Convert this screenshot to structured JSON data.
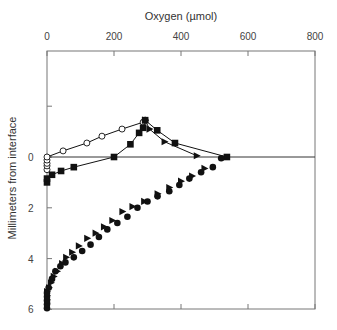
{
  "chart_data": {
    "type": "scatter",
    "title": "",
    "xlabel": "Oxygen (µmol)",
    "ylabel": "Millimeters from interface",
    "xlim": [
      0,
      800
    ],
    "ylim": [
      -4.2,
      6
    ],
    "y_inverted": true,
    "x_axis_position": "top",
    "x_ticks": [
      0,
      200,
      400,
      600,
      800
    ],
    "y_ticks": [
      0,
      2,
      4,
      6
    ],
    "y_minor_ticks": [
      -2
    ],
    "grid": false,
    "reference_line": {
      "y": 0,
      "label": "interface"
    },
    "series": [
      {
        "name": "open circles",
        "marker": "open-circle",
        "line": true,
        "points": [
          [
            0,
            0.5
          ],
          [
            0,
            0.35
          ],
          [
            0,
            0.25
          ],
          [
            0,
            0.12
          ],
          [
            0,
            0
          ],
          [
            48,
            -0.24
          ],
          [
            119,
            -0.55
          ],
          [
            164,
            -0.82
          ],
          [
            224,
            -1.1
          ],
          [
            287,
            -1.37
          ],
          [
            293,
            -1.45
          ]
        ]
      },
      {
        "name": "filled squares",
        "marker": "filled-square",
        "line": true,
        "points": [
          [
            0,
            1.0
          ],
          [
            0,
            0.85
          ],
          [
            15,
            0.7
          ],
          [
            42,
            0.55
          ],
          [
            80,
            0.4
          ],
          [
            200,
            0.0
          ],
          [
            249,
            -0.5
          ],
          [
            275,
            -0.95
          ],
          [
            287,
            -1.15
          ],
          [
            293,
            -1.45
          ],
          [
            329,
            -1.05
          ],
          [
            382,
            -0.55
          ],
          [
            537,
            0.0
          ]
        ]
      },
      {
        "name": "filled triangles (upper)",
        "marker": "filled-triangle-right",
        "line": true,
        "points": [
          [
            293,
            -1.45
          ],
          [
            306,
            -1.1
          ],
          [
            351,
            -0.6
          ],
          [
            447,
            -0.05
          ]
        ]
      },
      {
        "name": "filled triangles (lower)",
        "marker": "filled-triangle-right",
        "line": false,
        "points": [
          [
            0,
            5.75
          ],
          [
            0,
            5.6
          ],
          [
            0,
            5.45
          ],
          [
            0,
            5.3
          ],
          [
            6,
            5.15
          ],
          [
            12,
            4.95
          ],
          [
            20,
            4.7
          ],
          [
            30,
            4.5
          ],
          [
            45,
            4.2
          ],
          [
            57,
            3.95
          ],
          [
            75,
            3.75
          ],
          [
            95,
            3.5
          ],
          [
            120,
            3.2
          ],
          [
            145,
            3.0
          ],
          [
            170,
            2.75
          ],
          [
            195,
            2.5
          ],
          [
            225,
            2.15
          ],
          [
            255,
            1.95
          ],
          [
            290,
            1.75
          ],
          [
            330,
            1.45
          ],
          [
            365,
            1.2
          ],
          [
            400,
            0.95
          ],
          [
            433,
            0.75
          ],
          [
            470,
            0.45
          ]
        ]
      },
      {
        "name": "filled circles (lower)",
        "marker": "filled-circle",
        "line": false,
        "points": [
          [
            0,
            5.95
          ],
          [
            0,
            5.8
          ],
          [
            0,
            5.65
          ],
          [
            0,
            5.5
          ],
          [
            0,
            5.35
          ],
          [
            5,
            5.15
          ],
          [
            15,
            4.8
          ],
          [
            25,
            4.5
          ],
          [
            40,
            4.3
          ],
          [
            55,
            4.15
          ],
          [
            80,
            3.95
          ],
          [
            105,
            3.7
          ],
          [
            130,
            3.45
          ],
          [
            155,
            3.15
          ],
          [
            180,
            2.85
          ],
          [
            210,
            2.6
          ],
          [
            240,
            2.35
          ],
          [
            270,
            2.0
          ],
          [
            300,
            1.75
          ],
          [
            330,
            1.55
          ],
          [
            365,
            1.35
          ],
          [
            395,
            1.1
          ],
          [
            425,
            0.85
          ],
          [
            460,
            0.6
          ],
          [
            495,
            0.4
          ],
          [
            520,
            0.05
          ]
        ]
      }
    ]
  }
}
